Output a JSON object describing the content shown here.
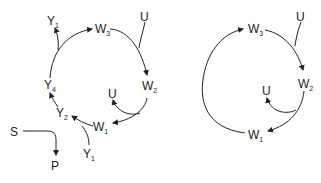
{
  "left_diagram": {
    "nodes": [
      {
        "id": "W3",
        "base": "W",
        "sub": "3"
      },
      {
        "id": "W2",
        "base": "W",
        "sub": "2"
      },
      {
        "id": "W1",
        "base": "W",
        "sub": "1"
      },
      {
        "id": "U_top",
        "base": "U",
        "sub": ""
      },
      {
        "id": "U_inner",
        "base": "U",
        "sub": ""
      },
      {
        "id": "Y1_top",
        "base": "Y",
        "sub": "1"
      },
      {
        "id": "Y4",
        "base": "Y",
        "sub": "4"
      },
      {
        "id": "Y2",
        "base": "Y",
        "sub": "2"
      },
      {
        "id": "Y1_bottom",
        "base": "Y",
        "sub": "1"
      },
      {
        "id": "S",
        "base": "S",
        "sub": ""
      },
      {
        "id": "P",
        "base": "P",
        "sub": ""
      }
    ]
  },
  "right_diagram": {
    "nodes": [
      {
        "id": "W3",
        "base": "W",
        "sub": "3"
      },
      {
        "id": "W2",
        "base": "W",
        "sub": "2"
      },
      {
        "id": "W1",
        "base": "W",
        "sub": "1"
      },
      {
        "id": "U_top",
        "base": "U",
        "sub": ""
      },
      {
        "id": "U_inner",
        "base": "U",
        "sub": ""
      }
    ]
  }
}
